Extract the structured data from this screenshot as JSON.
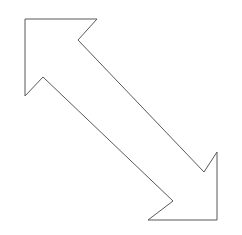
{
  "canvas": {
    "width": 242,
    "height": 235,
    "background_color": "#ffffff"
  },
  "shape": {
    "name": "double-headed-diagonal-arrow",
    "semantic_label": "resize-diagonal-arrow",
    "description": "Outlined double-headed arrow pointing to the upper-left and the lower-right",
    "direction": "northwest-southeast",
    "heads": 2,
    "fill_color": "#ffffff",
    "stroke_color": "#595959",
    "stroke_width": 1,
    "vertex_count": 10,
    "points": "25,19 97,19 78,40 204,172 217,152 217,220 148,220 173,201 43,77 25,96",
    "vertices": [
      {
        "label": "upper-head-top-left-corner",
        "x": 25,
        "y": 19
      },
      {
        "label": "upper-head-top-right-tip",
        "x": 97,
        "y": 19
      },
      {
        "label": "upper-head-inner-notch",
        "x": 78,
        "y": 40
      },
      {
        "label": "lower-head-inner-notch",
        "x": 204,
        "y": 172
      },
      {
        "label": "lower-head-top-right-tip",
        "x": 217,
        "y": 152
      },
      {
        "label": "lower-head-bottom-right-corner",
        "x": 217,
        "y": 220
      },
      {
        "label": "lower-head-bottom-left-tip",
        "x": 148,
        "y": 220
      },
      {
        "label": "lower-head-notch-peak",
        "x": 173,
        "y": 201
      },
      {
        "label": "upper-head-notch-peak",
        "x": 43,
        "y": 77
      },
      {
        "label": "upper-head-bottom-left-tip",
        "x": 25,
        "y": 96
      }
    ]
  }
}
